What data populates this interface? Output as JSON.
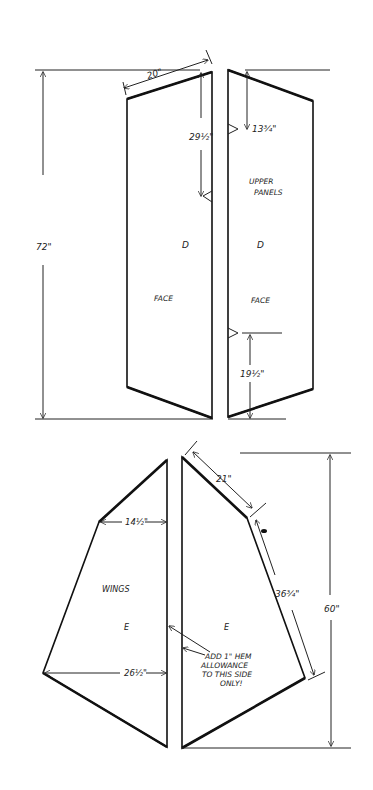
{
  "diagram": {
    "upper_panels": {
      "title": "UPPER PANELS",
      "left_panel": {
        "letter": "D",
        "face_label": "FACE"
      },
      "right_panel": {
        "letter": "D",
        "face_label": "FACE"
      },
      "dimensions": {
        "total_height": "72\"",
        "top_width": "20\"",
        "left_side_height": "29½\"",
        "right_top_drop": "13¾\"",
        "right_bottom_height": "19½\""
      }
    },
    "wings": {
      "title": "WINGS",
      "left_panel": {
        "letter": "E"
      },
      "right_panel": {
        "letter": "E"
      },
      "dimensions": {
        "upper_width": "14½\"",
        "lower_width": "26½\"",
        "top_edge": "21\"",
        "side_edge": "36¾\"",
        "total_height": "60\""
      },
      "note": [
        "ADD 1\" HEM",
        "ALLOWANCE",
        "TO THIS SIDE",
        "ONLY!"
      ]
    }
  }
}
